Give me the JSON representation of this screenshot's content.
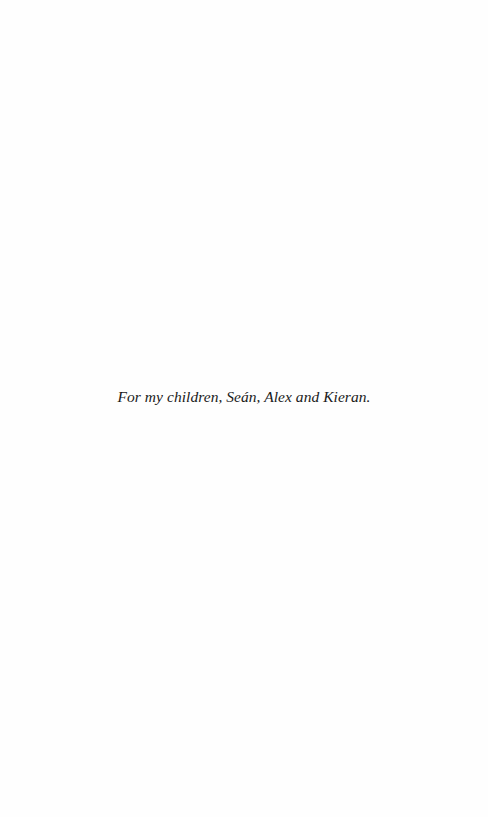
{
  "page": {
    "dedication": "For my children, Seán, Alex and Kieran."
  }
}
